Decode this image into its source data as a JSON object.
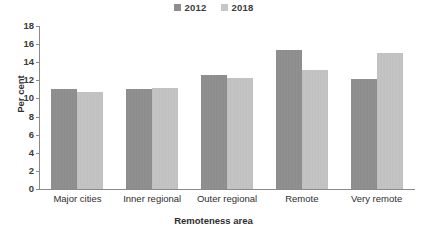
{
  "chart_data": {
    "type": "bar",
    "title": "",
    "xlabel": "Remoteness area",
    "ylabel": "Per cent",
    "categories": [
      "Major cities",
      "Inner regional",
      "Outer regional",
      "Remote",
      "Very remote"
    ],
    "series": [
      {
        "name": "2012",
        "color": "#8e8e8e",
        "values": [
          11.0,
          11.0,
          12.6,
          15.4,
          12.2
        ]
      },
      {
        "name": "2018",
        "color": "#c6c6c6",
        "values": [
          10.7,
          11.1,
          12.25,
          13.1,
          15.0
        ]
      }
    ],
    "ylim": [
      0,
      18
    ],
    "yticks": [
      0,
      2,
      4,
      6,
      8,
      10,
      12,
      14,
      16,
      18
    ],
    "ytick_labels": [
      "0",
      "2",
      "4",
      "6",
      "8",
      "10",
      "12",
      "14",
      "16",
      "18"
    ],
    "grid": false,
    "legend_position": "top-center",
    "axis_color": "#8a8a8a"
  }
}
